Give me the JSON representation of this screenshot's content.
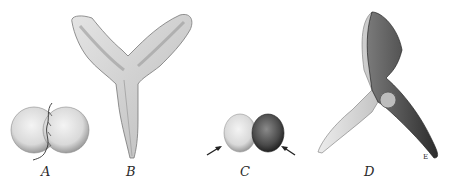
{
  "figure": {
    "panels": [
      {
        "id": "A",
        "label": "A",
        "subject": "two-lobed spherical body with thread"
      },
      {
        "id": "B",
        "label": "B",
        "subject": "Y-shaped seedling with two wavy cotyledons"
      },
      {
        "id": "C",
        "label": "C",
        "subject": "two-lobed body, one lobe dark, with two arrows"
      },
      {
        "id": "D",
        "label": "D",
        "subject": "three-armed shaded structure"
      }
    ],
    "signature": "E",
    "colors": {
      "background": "#ffffff",
      "ink": "#2a2a2a",
      "shade": "#6a6a6a",
      "light": "#d8d8d8"
    }
  }
}
